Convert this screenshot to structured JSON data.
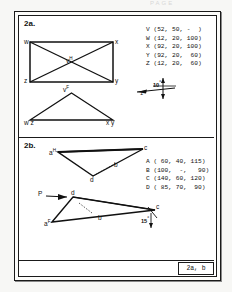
{
  "page": {
    "faint_header": "PAGE",
    "title_block": "2a, b"
  },
  "sections": [
    {
      "id": "2a",
      "label": "2a.",
      "coordinates": "V (52, 50, -  )\nW (12, 20, 100)\nX (92, 20, 100)\nY (92, 20,  60)\nZ (12, 20,  60)",
      "coordinate_rows": [
        {
          "point": "V",
          "x": "52",
          "y": "50",
          "z": "-"
        },
        {
          "point": "W",
          "x": "12",
          "y": "20",
          "z": "100"
        },
        {
          "point": "X",
          "x": "92",
          "y": "20",
          "z": "100"
        },
        {
          "point": "Y",
          "x": "92",
          "y": "20",
          "z": "60"
        },
        {
          "point": "Z",
          "x": "12",
          "y": "20",
          "z": "60"
        }
      ],
      "top_view": {
        "name": "horizontal-projection-rectangle",
        "vertex_labels": {
          "tl": "w",
          "tr": "x",
          "bl": "z",
          "br": "y"
        },
        "apex_label": "v",
        "apex_sup": "H"
      },
      "front_view": {
        "name": "frontal-projection-triangle",
        "apex_label": "v",
        "apex_sup": "F",
        "base_left": "w z",
        "base_right": "x y"
      },
      "scale_marker": {
        "angle": "10",
        "degree_symbol": "°",
        "unit": "1"
      }
    },
    {
      "id": "2b",
      "label": "2b.",
      "coordinates": "A ( 60, 40, 115)\nB (100,  -,   90)\nC (140, 60, 120)\nD ( 85, 70,  90)",
      "coordinate_rows": [
        {
          "point": "A",
          "x": "60",
          "y": "40",
          "z": "115"
        },
        {
          "point": "B",
          "x": "100",
          "y": "-",
          "z": "90"
        },
        {
          "point": "C",
          "x": "140",
          "y": "60",
          "z": "120"
        },
        {
          "point": "D",
          "x": "85",
          "y": "70",
          "z": "90"
        }
      ],
      "top_view": {
        "name": "horizontal-projection-triangle",
        "labels": {
          "a": "a",
          "a_sup": "H",
          "b": "b",
          "c": "c",
          "d": "d"
        }
      },
      "front_view": {
        "name": "frontal-projection-triangle",
        "labels": {
          "a": "a",
          "a_sup": "F",
          "b": "b",
          "c": "c",
          "d": "d"
        },
        "arrow_label": "P",
        "angle": "15",
        "degree_symbol": "°"
      }
    }
  ],
  "colors": {
    "ink": "#111111",
    "paper": "#ffffff",
    "sheet": "#f7f7f5"
  }
}
